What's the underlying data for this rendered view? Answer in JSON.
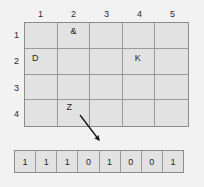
{
  "grid": {
    "column_headers": [
      "1",
      "2",
      "3",
      "4",
      "5"
    ],
    "row_headers": [
      "1",
      "2",
      "3",
      "4"
    ],
    "cells": [
      [
        "",
        "&",
        "",
        "",
        ""
      ],
      [
        "D",
        "",
        "",
        "K",
        ""
      ],
      [
        "",
        "",
        "",
        "",
        ""
      ],
      [
        "",
        "Z",
        "",
        "",
        ""
      ]
    ]
  },
  "arrow": {
    "label": "pointer-from-Z-cell-to-bit-strip"
  },
  "bitstrip": {
    "bits": [
      "1",
      "1",
      "1",
      "0",
      "1",
      "0",
      "0",
      "1"
    ]
  },
  "colors": {
    "background": "#f2f2f2",
    "cell_fill": "#e2e2e2",
    "outer_border": "#8c8c8c",
    "inner_line": "#9a9a9a",
    "text": "#1e1e1e",
    "arrow": "#111111"
  }
}
